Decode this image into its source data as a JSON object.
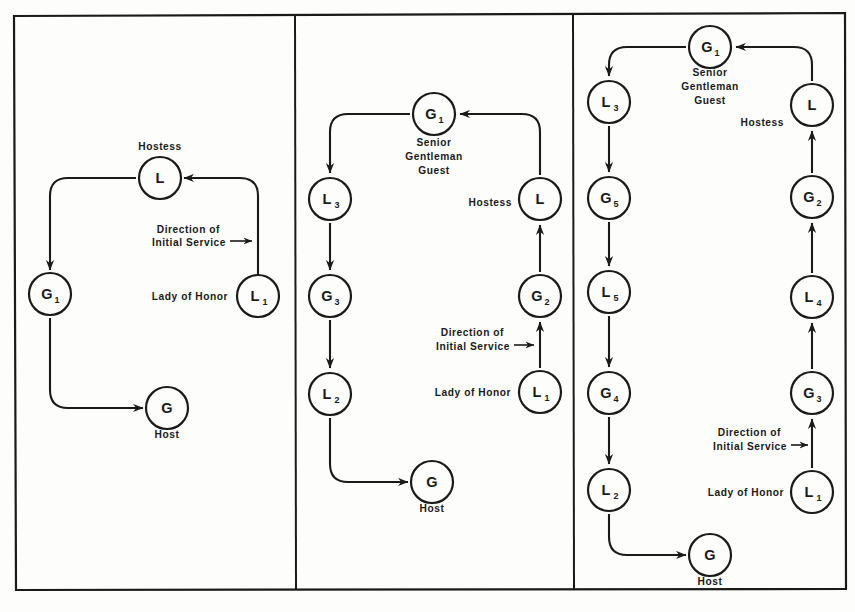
{
  "figure": {
    "panel_count": 3,
    "line_color": "#1a1a1a",
    "background_color": "#fdfdfb"
  },
  "captions": {
    "hostess": "Hostess",
    "host": "Host",
    "lady_of_honor": "Lady of Honor",
    "senior_gentleman_guest_1": "Senior",
    "senior_gentleman_guest_2": "Gentleman",
    "senior_gentleman_guest_3": "Guest",
    "direction_1": "Direction of",
    "direction_2": "Initial Service"
  },
  "panels": [
    {
      "name": "panel-one",
      "nodes": [
        {
          "id": "p1-L",
          "label": "L",
          "sub": "",
          "cx": 160,
          "cy": 178
        },
        {
          "id": "p1-G1",
          "label": "G",
          "sub": "1",
          "cx": 50,
          "cy": 294
        },
        {
          "id": "p1-L1",
          "label": "L",
          "sub": "1",
          "cx": 258,
          "cy": 296
        },
        {
          "id": "p1-G",
          "label": "G",
          "sub": "",
          "cx": 167,
          "cy": 408
        }
      ],
      "captions": [
        {
          "text": "Hostess",
          "x": 160,
          "y": 150,
          "anchor": "middle"
        },
        {
          "text": "Host",
          "x": 167,
          "y": 438,
          "anchor": "middle"
        },
        {
          "text": "Lady of Honor",
          "x": 228,
          "y": 300,
          "anchor": "end"
        },
        {
          "text": "Direction of",
          "x": 220,
          "y": 233,
          "anchor": "end"
        },
        {
          "text": "Initial Service",
          "x": 226,
          "y": 246,
          "anchor": "end"
        }
      ]
    },
    {
      "name": "panel-two",
      "nodes": [
        {
          "id": "p2-G1",
          "label": "G",
          "sub": "1",
          "cx": 434,
          "cy": 114
        },
        {
          "id": "p2-L3",
          "label": "L",
          "sub": "3",
          "cx": 330,
          "cy": 199
        },
        {
          "id": "p2-L",
          "label": "L",
          "sub": "",
          "cx": 540,
          "cy": 199
        },
        {
          "id": "p2-G3",
          "label": "G",
          "sub": "3",
          "cx": 330,
          "cy": 296
        },
        {
          "id": "p2-G2",
          "label": "G",
          "sub": "2",
          "cx": 540,
          "cy": 296
        },
        {
          "id": "p2-L2",
          "label": "L",
          "sub": "2",
          "cx": 330,
          "cy": 394
        },
        {
          "id": "p2-L1",
          "label": "L",
          "sub": "1",
          "cx": 540,
          "cy": 392
        },
        {
          "id": "p2-G",
          "label": "G",
          "sub": "",
          "cx": 432,
          "cy": 482
        }
      ],
      "captions": [
        {
          "text": "Senior",
          "x": 434,
          "y": 146,
          "anchor": "middle"
        },
        {
          "text": "Gentleman",
          "x": 434,
          "y": 160,
          "anchor": "middle"
        },
        {
          "text": "Guest",
          "x": 434,
          "y": 174,
          "anchor": "middle"
        },
        {
          "text": "Hostess",
          "x": 512,
          "y": 206,
          "anchor": "end"
        },
        {
          "text": "Direction of",
          "x": 504,
          "y": 336,
          "anchor": "end"
        },
        {
          "text": "Initial Service",
          "x": 510,
          "y": 350,
          "anchor": "end"
        },
        {
          "text": "Lady of Honor",
          "x": 511,
          "y": 396,
          "anchor": "end"
        },
        {
          "text": "Host",
          "x": 432,
          "y": 512,
          "anchor": "middle"
        }
      ]
    },
    {
      "name": "panel-three",
      "nodes": [
        {
          "id": "p3-G1",
          "label": "G",
          "sub": "1",
          "cx": 710,
          "cy": 47
        },
        {
          "id": "p3-L3",
          "label": "L",
          "sub": "3",
          "cx": 609,
          "cy": 102
        },
        {
          "id": "p3-L",
          "label": "L",
          "sub": "",
          "cx": 812,
          "cy": 105
        },
        {
          "id": "p3-G5",
          "label": "G",
          "sub": "5",
          "cx": 609,
          "cy": 198
        },
        {
          "id": "p3-G2",
          "label": "G",
          "sub": "2",
          "cx": 812,
          "cy": 197
        },
        {
          "id": "p3-L5",
          "label": "L",
          "sub": "5",
          "cx": 609,
          "cy": 292
        },
        {
          "id": "p3-L4",
          "label": "L",
          "sub": "4",
          "cx": 812,
          "cy": 297
        },
        {
          "id": "p3-G4",
          "label": "G",
          "sub": "4",
          "cx": 609,
          "cy": 393
        },
        {
          "id": "p3-G3",
          "label": "G",
          "sub": "3",
          "cx": 812,
          "cy": 393
        },
        {
          "id": "p3-L2",
          "label": "L",
          "sub": "2",
          "cx": 609,
          "cy": 490
        },
        {
          "id": "p3-L1",
          "label": "L",
          "sub": "1",
          "cx": 812,
          "cy": 492
        },
        {
          "id": "p3-G",
          "label": "G",
          "sub": "",
          "cx": 710,
          "cy": 555
        }
      ],
      "captions": [
        {
          "text": "Senior",
          "x": 710,
          "y": 76,
          "anchor": "middle"
        },
        {
          "text": "Gentleman",
          "x": 710,
          "y": 90,
          "anchor": "middle"
        },
        {
          "text": "Guest",
          "x": 710,
          "y": 104,
          "anchor": "middle"
        },
        {
          "text": "Hostess",
          "x": 784,
          "y": 126,
          "anchor": "end"
        },
        {
          "text": "Direction of",
          "x": 781,
          "y": 436,
          "anchor": "end"
        },
        {
          "text": "Initial Service",
          "x": 787,
          "y": 450,
          "anchor": "end"
        },
        {
          "text": "Lady of Honor",
          "x": 784,
          "y": 496,
          "anchor": "end"
        },
        {
          "text": "Host",
          "x": 710,
          "y": 585,
          "anchor": "middle"
        }
      ]
    }
  ],
  "flows": {
    "panel_one": "L1 -> L (Hostess) -> G1 -> G (Host)",
    "panel_two": "L1 -> G2 -> L (Hostess) -> G1 -> L3 -> G3 -> L2 -> G (Host)",
    "panel_three": "L1 -> G3 -> L4 -> G2 -> L (Hostess) -> G1 -> L3 -> G5 -> L5 -> G4 -> L2 -> G (Host)"
  }
}
